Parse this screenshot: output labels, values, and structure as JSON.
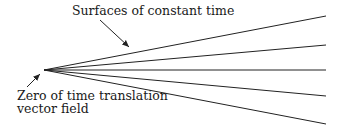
{
  "diagram": {
    "labels": {
      "top": "Surfaces of constant time",
      "bottom_line1": "Zero of time translation",
      "bottom_line2": "vector field"
    },
    "vertex": [
      44,
      70
    ],
    "rays": [
      {
        "name": "ray-1",
        "end": [
          326,
          16
        ]
      },
      {
        "name": "ray-2",
        "end": [
          326,
          45
        ]
      },
      {
        "name": "ray-3",
        "end": [
          326,
          70
        ]
      },
      {
        "name": "ray-4",
        "end": [
          326,
          96
        ]
      },
      {
        "name": "ray-5",
        "end": [
          326,
          124
        ]
      }
    ],
    "arrows": [
      {
        "name": "top-arrow",
        "from": [
          100,
          20
        ],
        "to": [
          129,
          47
        ]
      },
      {
        "name": "bottom-arrow",
        "from": [
          27,
          87
        ],
        "to": [
          40,
          74
        ]
      }
    ],
    "colors": {
      "stroke": "#222222",
      "text": "#1a1a1a"
    }
  }
}
